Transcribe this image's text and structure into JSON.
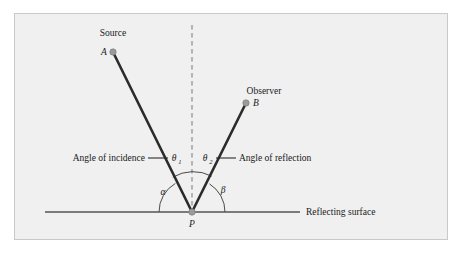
{
  "figure": {
    "background_color": "#f0f0f0",
    "border_color": "#c9c9c9",
    "page_color": "#ffffff"
  },
  "labels": {
    "source": "Source",
    "point_a": "A",
    "observer": "Observer",
    "point_b": "B",
    "point_p": "P",
    "angle_of_incidence": "Angle of incidence",
    "angle_of_reflection": "Angle of reflection",
    "theta_1": "θ",
    "theta_1_sub": "1",
    "theta_2": "θ",
    "theta_2_sub": "2",
    "alpha": "α",
    "beta": "β",
    "reflecting_surface": "Reflecting surface"
  },
  "colors": {
    "ray": "#2b2b2b",
    "surface_line": "#555555",
    "normal_dash": "#8c8c8c",
    "arc": "#4a4a4a",
    "point_dot": "#9a9a9a",
    "point_dot_edge": "#777777",
    "leader": "#2b2b2b",
    "text": "#1a1a1a"
  },
  "geometry": {
    "vertex_p": {
      "x": 192,
      "y": 212
    },
    "point_a": {
      "x": 113,
      "y": 52
    },
    "point_b": {
      "x": 246,
      "y": 103
    },
    "surface_line": {
      "x1": 45,
      "y1": 212,
      "x2": 300,
      "y2": 212
    },
    "normal_line": {
      "x1": 192,
      "y1": 25,
      "x2": 192,
      "y2": 212
    },
    "theta_arc_radius": 40,
    "alpha_arc_radius": 33,
    "beta_arc_radius": 33,
    "ray_width": 2.6,
    "dot_radius": 3.2
  }
}
